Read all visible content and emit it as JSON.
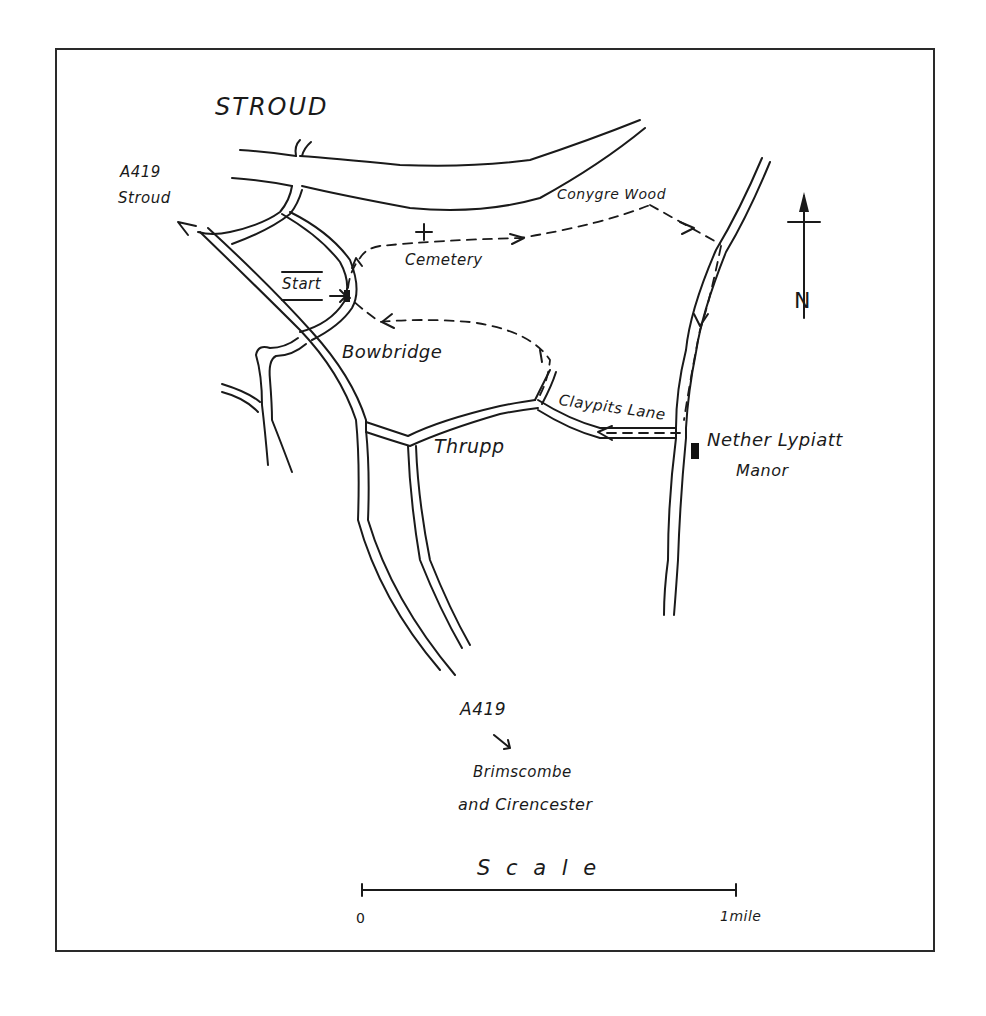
{
  "map": {
    "colors": {
      "ink": "#1a1a1a",
      "background": "#ffffff",
      "frame": "#2a2a2a"
    },
    "labels": {
      "town": "STROUD",
      "a419_north_road": "A419",
      "a419_north_dest": "Stroud",
      "conygre_wood": "Conygre Wood",
      "cemetery": "Cemetery",
      "start": "Start",
      "bowbridge": "Bowbridge",
      "claypits_lane": "Claypits Lane",
      "thrupp": "Thrupp",
      "nether_lypiatt_line1": "Nether Lypiatt",
      "nether_lypiatt_line2": "Manor",
      "a419_south_road": "A419",
      "a419_south_dest_line1": "Brimscombe",
      "a419_south_dest_line2": "and Cirencester",
      "north": "N"
    },
    "scale": {
      "title": "S c a l e",
      "start": "0",
      "end": "1mile"
    },
    "icons": {
      "cemetery": "cross-icon",
      "manor": "building-icon",
      "north": "north-arrow-icon",
      "route": "dashed-route-arrows"
    }
  }
}
